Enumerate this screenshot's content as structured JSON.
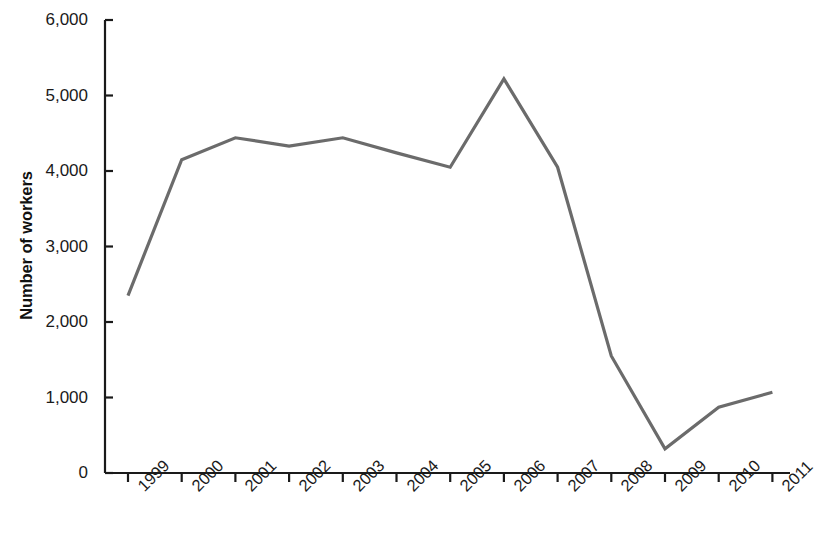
{
  "chart_data": {
    "type": "line",
    "title": "",
    "subtitle": "",
    "xlabel": "",
    "ylabel": "Number of workers",
    "categories": [
      "1999",
      "2000",
      "2001",
      "2002",
      "2003",
      "2004",
      "2005",
      "2006",
      "2007",
      "2008",
      "2009",
      "2010",
      "2011"
    ],
    "values": [
      2350,
      4150,
      4440,
      4330,
      4440,
      4240,
      4050,
      5220,
      4050,
      1550,
      320,
      870,
      1070
    ],
    "series": [
      {
        "name": "Number of workers",
        "values": [
          2350,
          4150,
          4440,
          4330,
          4440,
          4240,
          4050,
          5220,
          4050,
          1550,
          320,
          870,
          1070
        ]
      }
    ],
    "ylim": [
      0,
      6000
    ],
    "ytick_labels": [
      "0",
      "1,000",
      "2,000",
      "3,000",
      "4,000",
      "5,000",
      "6,000"
    ],
    "ytick_values": [
      0,
      1000,
      2000,
      3000,
      4000,
      5000,
      6000
    ],
    "grid": false,
    "legend": false,
    "legend_position": "none",
    "line_color": "#6b6b6b",
    "axis_color": "#1a1a1a",
    "background_color": "#ffffff",
    "annotations": []
  }
}
